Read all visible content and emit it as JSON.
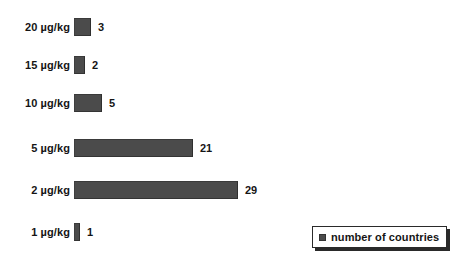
{
  "chart_data": {
    "type": "bar",
    "orientation": "horizontal",
    "title": "",
    "xlabel": "",
    "ylabel": "",
    "grid": false,
    "xlim": [
      0,
      29
    ],
    "categories": [
      "20 µg/kg",
      "15 µg/kg",
      "10 µg/kg",
      "5 µg/kg",
      "2 µg/kg",
      "1 µg/kg"
    ],
    "values": [
      3,
      2,
      5,
      21,
      29,
      1
    ],
    "value_labels": [
      "3",
      "2",
      "5",
      "21",
      "29",
      "1"
    ],
    "series": [
      {
        "name": "number of countries",
        "values": [
          3,
          2,
          5,
          21,
          29,
          1
        ],
        "color": "#4b4b4b"
      }
    ],
    "legend": {
      "position": "bottom-right",
      "entries": [
        {
          "label": "number of countries",
          "color": "#4b4b4b"
        }
      ]
    }
  },
  "colors": {
    "bar": "#4b4b4b",
    "text": "#151515",
    "background": "#ffffff",
    "legend_border": "#2a2a2a"
  }
}
